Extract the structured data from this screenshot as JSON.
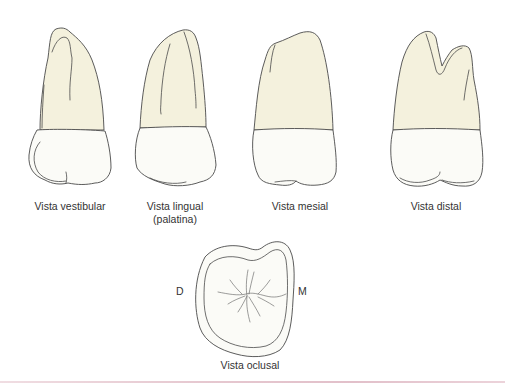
{
  "figure": {
    "views": [
      {
        "id": "vestibular",
        "label": "Vista vestibular"
      },
      {
        "id": "lingual",
        "label": "Vista lingual",
        "sublabel": "(palatina)"
      },
      {
        "id": "mesial",
        "label": "Vista mesial"
      },
      {
        "id": "distal",
        "label": "Vista distal"
      }
    ],
    "occlusal": {
      "label": "Vista oclusal",
      "left_marker": "D",
      "right_marker": "M"
    },
    "colors": {
      "root": "#f4f1dd",
      "crown": "#fbfbf7",
      "outline": "#4a4a4a",
      "text": "#333333",
      "bottom_rule": "#e4c4cd"
    }
  }
}
